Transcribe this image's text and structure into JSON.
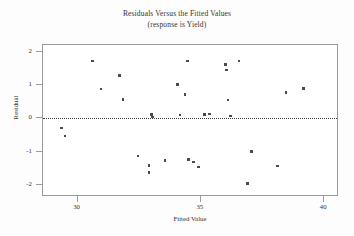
{
  "chart_data": {
    "type": "scatter",
    "title": "Residuals Versus the Fitted Values",
    "subtitle": "(response is Yield)",
    "xlabel": "Fitted Value",
    "ylabel": "Residual",
    "xlim": [
      28.6,
      40.6
    ],
    "ylim": [
      -2.35,
      2.2
    ],
    "xticks": [
      30,
      35,
      40
    ],
    "xtick_labels": [
      "30",
      "35",
      "40"
    ],
    "yticks": [
      2,
      1,
      0,
      -1,
      -2
    ],
    "ytick_labels": [
      "2",
      "1",
      "0",
      "-1",
      "-2"
    ],
    "grid": false,
    "legend": false,
    "reference_line": {
      "orientation": "horizontal",
      "value": 0,
      "style": "dotted",
      "color": "#3a3a3a"
    },
    "marker": {
      "shape": "square",
      "color": "#4a4a4a",
      "size": 2.6
    },
    "points": [
      {
        "x": 29.35,
        "y": -0.28
      },
      {
        "x": 29.5,
        "y": -0.52
      },
      {
        "x": 30.6,
        "y": 1.72
      },
      {
        "x": 30.95,
        "y": 0.88
      },
      {
        "x": 31.7,
        "y": 1.28
      },
      {
        "x": 31.85,
        "y": 0.57
      },
      {
        "x": 32.45,
        "y": -1.12
      },
      {
        "x": 32.9,
        "y": -1.4
      },
      {
        "x": 33.0,
        "y": 0.12
      },
      {
        "x": 33.05,
        "y": 0.05
      },
      {
        "x": 32.9,
        "y": -1.62
      },
      {
        "x": 33.55,
        "y": -1.25
      },
      {
        "x": 34.15,
        "y": 0.1
      },
      {
        "x": 34.45,
        "y": 1.72
      },
      {
        "x": 34.5,
        "y": -1.23
      },
      {
        "x": 34.35,
        "y": 0.72
      },
      {
        "x": 34.9,
        "y": -1.45
      },
      {
        "x": 35.15,
        "y": 0.12
      },
      {
        "x": 35.35,
        "y": 0.14
      },
      {
        "x": 34.05,
        "y": 1.02
      },
      {
        "x": 34.7,
        "y": -1.3
      },
      {
        "x": 36.0,
        "y": 1.62
      },
      {
        "x": 36.05,
        "y": 1.45
      },
      {
        "x": 36.1,
        "y": 0.55
      },
      {
        "x": 36.2,
        "y": 0.08
      },
      {
        "x": 37.05,
        "y": -0.98
      },
      {
        "x": 36.55,
        "y": 1.72
      },
      {
        "x": 36.9,
        "y": -1.95
      },
      {
        "x": 38.1,
        "y": -1.42
      },
      {
        "x": 38.45,
        "y": 0.78
      },
      {
        "x": 39.15,
        "y": 0.9
      }
    ]
  }
}
